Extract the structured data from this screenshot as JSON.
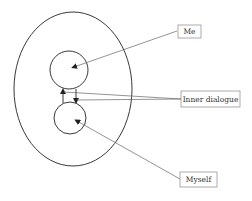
{
  "diagram": {
    "labels": {
      "me": "Me",
      "inner_dialogue": "Inner dialogue",
      "myself": "Myself"
    },
    "colors": {
      "stroke": "#222222",
      "leader": "#666666",
      "box": "#888888",
      "background": "#ffffff"
    }
  }
}
